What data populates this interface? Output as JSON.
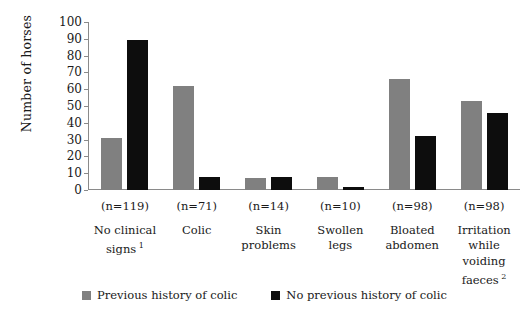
{
  "chart_data": {
    "type": "bar",
    "title": "",
    "subtitle": "",
    "xlabel": "",
    "ylabel": "Number of horses",
    "ylim": [
      0,
      100
    ],
    "ytick_step": 10,
    "yticks": [
      "100",
      "90",
      "80",
      "70",
      "60",
      "50",
      "40",
      "30",
      "20",
      "10",
      "0"
    ],
    "grid": false,
    "legend_position": "bottom-center",
    "categories": [
      "No clinical signs",
      "Colic",
      "Skin problems",
      "Swollen legs",
      "Bloated abdomen",
      "Irritation while voiding faeces"
    ],
    "category_footnotes": [
      "1",
      "",
      "",
      "",
      "",
      "2"
    ],
    "category_counts": [
      "(n=119)",
      "(n=71)",
      "(n=14)",
      "(n=10)",
      "(n=98)",
      "(n=98)"
    ],
    "series": [
      {
        "name": "Previous history of colic",
        "color": "#808080",
        "values": [
          31,
          62,
          7,
          8,
          66,
          53
        ]
      },
      {
        "name": "No previous history of colic",
        "color": "#0d0d0d",
        "values": [
          89,
          8,
          8,
          2,
          32,
          46
        ]
      }
    ]
  },
  "axis": {
    "y_title": "Number of horses"
  },
  "categories_display": [
    {
      "count": "(n=119)",
      "line1": "No clinical",
      "line2": "signs",
      "footnote": "1"
    },
    {
      "count": "(n=71)",
      "line1": "Colic",
      "line2": "",
      "footnote": ""
    },
    {
      "count": "(n=14)",
      "line1": "Skin",
      "line2": "problems",
      "footnote": ""
    },
    {
      "count": "(n=10)",
      "line1": "Swollen legs",
      "line2": "",
      "footnote": ""
    },
    {
      "count": "(n=98)",
      "line1": "Bloated",
      "line2": "abdomen",
      "footnote": ""
    },
    {
      "count": "(n=98)",
      "line1": "Irritation",
      "line2": "while",
      "line3": "voiding",
      "line4": "faeces",
      "footnote": "2"
    }
  ],
  "legend": {
    "items": [
      {
        "label": "Previous history of colic",
        "color": "#808080"
      },
      {
        "label": "No previous history of colic",
        "color": "#0d0d0d"
      }
    ]
  }
}
